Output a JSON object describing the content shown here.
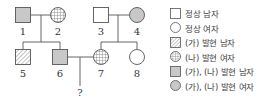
{
  "pedigree": {
    "individuals": [
      {
        "id": "1",
        "label": "1",
        "sex": "male",
        "phenotype": "(가), (나) 발현"
      },
      {
        "id": "2",
        "label": "2",
        "sex": "female",
        "phenotype": "(나) 발현"
      },
      {
        "id": "3",
        "label": "3",
        "sex": "male",
        "phenotype": "정상"
      },
      {
        "id": "4",
        "label": "4",
        "sex": "female",
        "phenotype": "(가), (나) 발현"
      },
      {
        "id": "5",
        "label": "5",
        "sex": "male",
        "phenotype": "(가) 발현"
      },
      {
        "id": "6",
        "label": "6",
        "sex": "male",
        "phenotype": "(가), (나) 발현"
      },
      {
        "id": "7",
        "label": "7",
        "sex": "female",
        "phenotype": "(나) 발현"
      },
      {
        "id": "8",
        "label": "8",
        "sex": "female",
        "phenotype": "정상"
      }
    ],
    "unknown_child_label": "?"
  },
  "legend": {
    "items": [
      {
        "symbol": "square-empty",
        "label": "정상 남자"
      },
      {
        "symbol": "circle-empty",
        "label": "정상 여자"
      },
      {
        "symbol": "square-hatched",
        "label": "(가) 발현 남자"
      },
      {
        "symbol": "circle-grid",
        "label": "(나) 발현 여자"
      },
      {
        "symbol": "square-gray",
        "label": "(가), (나) 발현 남자"
      },
      {
        "symbol": "circle-gray",
        "label": "(가), (나) 발현 여자"
      }
    ]
  },
  "colors": {
    "line": "#555555",
    "gray_fill": "#c8c8c8",
    "pattern": "#777777"
  }
}
